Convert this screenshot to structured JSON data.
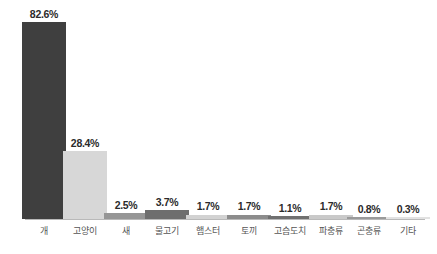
{
  "chart_data": {
    "type": "bar",
    "title": "",
    "xlabel": "",
    "ylabel": "",
    "ylim": [
      0,
      100
    ],
    "grid": false,
    "legend": "none",
    "orientation": "vertical",
    "value_suffix": "%",
    "categories": [
      "개",
      "고양이",
      "새",
      "물고기",
      "햄스터",
      "토끼",
      "고슴도치",
      "파충류",
      "곤충류",
      "기타"
    ],
    "values": [
      82.6,
      28.4,
      2.5,
      3.7,
      1.7,
      1.7,
      1.1,
      1.7,
      0.8,
      0.3
    ],
    "labels": [
      "82.6%",
      "28.4%",
      "2.5%",
      "3.7%",
      "1.7%",
      "1.7%",
      "1.1%",
      "1.7%",
      "0.8%",
      "0.3%"
    ],
    "bar_colors": [
      "#3f3f3f",
      "#d7d7d7",
      "#969696",
      "#6e6e6e",
      "#d2d2d2",
      "#8c8c8c",
      "#707070",
      "#c9c9c9",
      "#9a9a9a",
      "#e2e2e2"
    ],
    "axis_color": "#b9b9b9",
    "label_color": "#2b2b2b",
    "category_color": "#555555",
    "background": "#ffffff"
  }
}
